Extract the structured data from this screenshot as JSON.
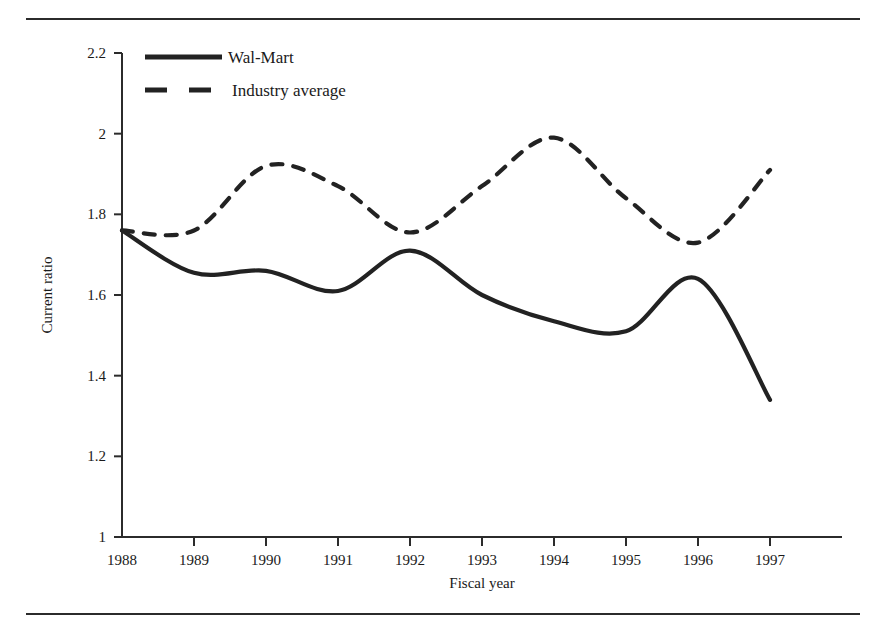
{
  "figure": {
    "background_color": "#ffffff",
    "ink_color": "#222222",
    "top_rule": true,
    "bottom_rule": true
  },
  "chart_data": {
    "type": "line",
    "title": "",
    "xlabel": "Fiscal year",
    "ylabel": "Current ratio",
    "x": [
      1988,
      1989,
      1990,
      1991,
      1992,
      1993,
      1994,
      1995,
      1996,
      1997
    ],
    "categories": [
      "1988",
      "1989",
      "1990",
      "1991",
      "1992",
      "1993",
      "1994",
      "1995",
      "1996",
      "1997"
    ],
    "xlim": [
      1988,
      1997
    ],
    "ylim": [
      1,
      2.2
    ],
    "yticks": [
      1,
      1.2,
      1.4,
      1.6,
      1.8,
      2,
      2.2
    ],
    "ytick_labels": [
      "1",
      "1.2",
      "1.4",
      "1.6",
      "1.8",
      "2",
      "2.2"
    ],
    "xticks": [
      1988,
      1989,
      1990,
      1991,
      1992,
      1993,
      1994,
      1995,
      1996,
      1997
    ],
    "xtick_labels": [
      "1988",
      "1989",
      "1990",
      "1991",
      "1992",
      "1993",
      "1994",
      "1995",
      "1996",
      "1997"
    ],
    "grid": false,
    "legend_position": "top-left-inside",
    "series": [
      {
        "name": "Wal-Mart",
        "style": "solid",
        "color": "#222222",
        "values": [
          1.76,
          1.655,
          1.66,
          1.61,
          1.71,
          1.6,
          1.535,
          1.51,
          1.64,
          1.34
        ]
      },
      {
        "name": "Industry average",
        "style": "dashed",
        "color": "#222222",
        "values": [
          1.76,
          1.76,
          1.92,
          1.87,
          1.755,
          1.87,
          1.99,
          1.84,
          1.73,
          1.91
        ]
      }
    ]
  },
  "legend": {
    "entries": [
      {
        "label": "Wal-Mart",
        "style": "solid"
      },
      {
        "label": "Industry average",
        "style": "dashed"
      }
    ]
  }
}
